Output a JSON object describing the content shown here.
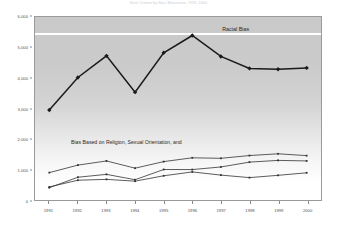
{
  "chart_data": {
    "type": "line",
    "title": "Hate Crimes by Bias Motivation, 1991-2000",
    "xlabel": "",
    "ylabel": "",
    "x": [
      1991,
      1992,
      1993,
      1994,
      1995,
      1996,
      1997,
      1998,
      1999,
      2000
    ],
    "categories": [
      "1991",
      "1992",
      "1993",
      "1994",
      "1995",
      "1996",
      "1997",
      "1998",
      "1999",
      "2000"
    ],
    "ylim": [
      0,
      6000
    ],
    "ytick_labels": [
      "0",
      "1,000",
      "2,000",
      "3,000",
      "4,000",
      "5,000",
      "6,000"
    ],
    "ytick_values": [
      0,
      1000,
      2000,
      3000,
      4000,
      5000,
      6000
    ],
    "grid": false,
    "legend_position": "inline-annotation",
    "series": [
      {
        "name": "Racial Bias",
        "values": [
          2963,
          4025,
          4732,
          3545,
          4831,
          5396,
          4711,
          4321,
          4295,
          4337
        ],
        "color": "#1a1a1a",
        "marker": "diamond"
      },
      {
        "name": "Religion",
        "values": [
          917,
          1162,
          1298,
          1062,
          1277,
          1401,
          1385,
          1475,
          1532,
          1472
        ],
        "color": "#333333",
        "marker": "small"
      },
      {
        "name": "Sexual Orientation",
        "values": [
          425,
          767,
          860,
          685,
          1019,
          1016,
          1102,
          1260,
          1317,
          1299
        ],
        "color": "#333333",
        "marker": "small"
      },
      {
        "name": "Ethnicity",
        "values": [
          450,
          669,
          697,
          638,
          814,
          940,
          836,
          754,
          829,
          911
        ],
        "color": "#333333",
        "marker": "small"
      }
    ],
    "annotations": [
      {
        "id": "racial-bias",
        "text": "Racial Bias"
      },
      {
        "id": "lower-group",
        "text": "Bias Based on Religion, Sexual Orientation, and"
      }
    ]
  }
}
